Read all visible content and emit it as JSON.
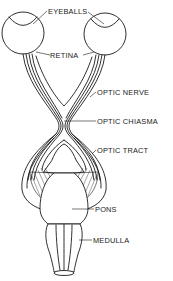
{
  "diagram": {
    "labels": {
      "eyeballs": "EYEBALLS",
      "retina": "RETINA",
      "optic_nerve": "OPTIC NERVE",
      "optic_chiasma": "OPTIC CHIASMA",
      "optic_tract": "OPTIC TRACT",
      "pons": "PONS",
      "medulla": "MEDULLA"
    },
    "colors": {
      "ink": "#1a1a1a",
      "background": "#ffffff"
    }
  }
}
